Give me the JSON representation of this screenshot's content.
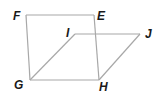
{
  "diagram": {
    "type": "geometry",
    "points": [
      {
        "name": "F",
        "label": "F",
        "x": 26,
        "y": 15,
        "lx": 13,
        "ly": 20
      },
      {
        "name": "E",
        "label": "E",
        "x": 94,
        "y": 15,
        "lx": 97,
        "ly": 20
      },
      {
        "name": "I",
        "label": "I",
        "x": 75,
        "y": 34,
        "lx": 65,
        "ly": 37
      },
      {
        "name": "J",
        "label": "J",
        "x": 140,
        "y": 34,
        "lx": 145,
        "ly": 38
      },
      {
        "name": "G",
        "label": "G",
        "x": 30,
        "y": 80,
        "lx": 14,
        "ly": 89
      },
      {
        "name": "H",
        "label": "H",
        "x": 99,
        "y": 80,
        "lx": 99,
        "ly": 91
      }
    ],
    "segments": [
      [
        "F",
        "E"
      ],
      [
        "F",
        "G"
      ],
      [
        "E",
        "H"
      ],
      [
        "G",
        "H"
      ],
      [
        "G",
        "I"
      ],
      [
        "I",
        "J"
      ],
      [
        "J",
        "H"
      ]
    ],
    "colors": {
      "edge": "#a8a8a8",
      "label": "#1a1a1a",
      "background": "#ffffff"
    }
  }
}
